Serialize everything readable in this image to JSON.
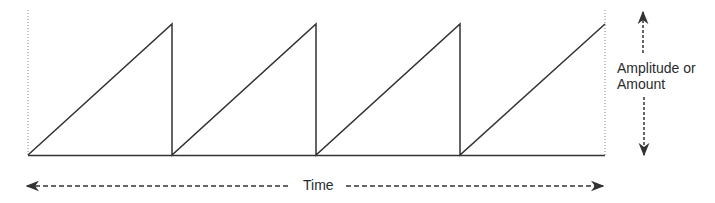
{
  "diagram": {
    "type": "sawtooth-wave",
    "labels": {
      "amplitude_line1": "Amplitude or",
      "amplitude_line2": "Amount",
      "time": "Time"
    },
    "colors": {
      "stroke": "#333333",
      "guide": "#888888",
      "text": "#2b2b2b"
    },
    "cycles": 4,
    "wave_points": [
      [
        28,
        155
      ],
      [
        172,
        24
      ],
      [
        172,
        155
      ],
      [
        316,
        24
      ],
      [
        316,
        155
      ],
      [
        460,
        24
      ],
      [
        460,
        155
      ],
      [
        605,
        24
      ]
    ]
  }
}
